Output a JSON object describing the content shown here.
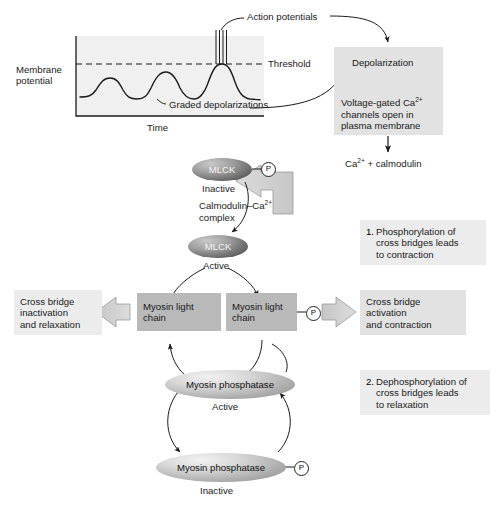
{
  "figure": {
    "type": "biological-pathway-diagram"
  },
  "graph": {
    "y_axis_label_line1": "Membrane",
    "y_axis_label_line2": "potential",
    "x_axis_label": "Time",
    "threshold_label": "Threshold",
    "action_potentials_label": "Action potentials",
    "graded_depolarizations_label": "Graded depolarizations",
    "spike_count": 4,
    "wave_peaks": 3
  },
  "boxes": {
    "depolarization": "Depolarization",
    "voltage_gated_l1": "Voltage-gated Ca",
    "voltage_gated_l1_sup": "2+",
    "voltage_gated_l2": "channels open in",
    "voltage_gated_l3": "plasma membrane",
    "step1_number": "1.",
    "step1_l1": "Phosphorylation of",
    "step1_l2": "cross bridges leads",
    "step1_l3": "to contraction",
    "step2_number": "2.",
    "step2_l1": "Dephosphorylation of",
    "step2_l2": "cross bridges leads",
    "step2_l3": "to relaxation",
    "cross_bridge_activation_l1": "Cross bridge",
    "cross_bridge_activation_l2": "activation",
    "cross_bridge_activation_l3": "and contraction",
    "cross_bridge_inactivation_l1": "Cross bridge",
    "cross_bridge_inactivation_l2": "inactivation",
    "cross_bridge_inactivation_l3": "and relaxation",
    "myosin_light_chain_left_l1": "Myosin light",
    "myosin_light_chain_left_l2": "chain",
    "myosin_light_chain_right_l1": "Myosin light",
    "myosin_light_chain_right_l2": "chain"
  },
  "labels": {
    "ca_calmodulin": "Ca",
    "ca_calmodulin_sup": "2+",
    "ca_calmodulin_rest": " + calmodulin",
    "calmodulin_complex_l1": "Calmodulin–Ca",
    "calmodulin_complex_l1_sup": "2+",
    "calmodulin_complex_l2": "complex",
    "mlck": "MLCK",
    "mlck_inactive_state": "Inactive",
    "mlck_active_state": "Active",
    "myosin_phosphatase": "Myosin phosphatase",
    "phosphatase_active_state": "Active",
    "phosphatase_inactive_state": "Inactive",
    "phosphate_symbol": "P"
  },
  "colors": {
    "plot_background": "#f0f0f0",
    "box_light": "#ececec",
    "box_medium": "#e2e2e2",
    "box_dark": "#b9b9b9",
    "line": "#1a1a1a",
    "big_arrow_fill": "#cfcfcf",
    "protein_dark": "#5f5f5f",
    "protein_light": "#d0d0d0"
  }
}
